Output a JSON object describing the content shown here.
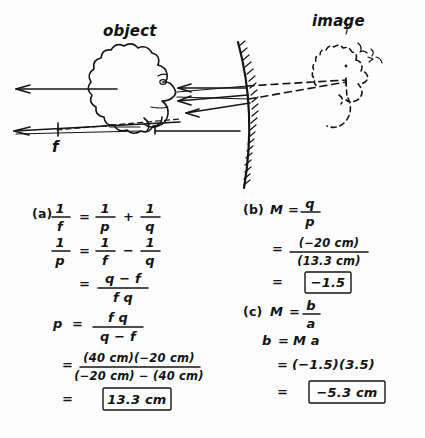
{
  "document": {
    "kind": "handwritten-physics-solution",
    "title_visible": false
  },
  "diagram": {
    "name": "convex-mirror-ray-diagram",
    "object_label": "object",
    "image_label": "image",
    "focal_point_label": "f",
    "mirror_type": "convex-mirror",
    "rays_count": 3,
    "axis_arrow_direction": "left"
  },
  "work": {
    "part_a": {
      "tag": "(a)",
      "lines": [
        {
          "id": "a1",
          "lhs_num": "1",
          "lhs_den": "f",
          "eq": "=",
          "t1_num": "1",
          "t1_den": "p",
          "op": "+",
          "t2_num": "1",
          "t2_den": "q"
        },
        {
          "id": "a2",
          "lhs_num": "1",
          "lhs_den": "p",
          "eq": "=",
          "t1_num": "1",
          "t1_den": "f",
          "op": "−",
          "t2_num": "1",
          "t2_den": "q"
        },
        {
          "id": "a3",
          "eq": "=",
          "num": "q − f",
          "den": "f q"
        },
        {
          "id": "a4",
          "lhs": "p",
          "eq": "=",
          "num": "f q",
          "den": "q − f"
        },
        {
          "id": "a5",
          "eq": "=",
          "num": "(40 cm)(−20 cm)",
          "den": "(−20 cm) − (40 cm)"
        },
        {
          "id": "a6",
          "eq": "=",
          "boxed": "13.3 cm"
        }
      ],
      "answer": "13.3 cm"
    },
    "part_b": {
      "tag": "(b)",
      "lines": [
        {
          "id": "b1",
          "lhs": "M",
          "eq": "=",
          "num": "q",
          "den": "p"
        },
        {
          "id": "b2",
          "eq": "=",
          "num": "(−20 cm)",
          "den": "(13.3 cm)"
        },
        {
          "id": "b3",
          "eq": "=",
          "boxed": "−1.5"
        }
      ],
      "answer": "−1.5"
    },
    "part_c": {
      "tag": "(c)",
      "lines": [
        {
          "id": "c1",
          "lhs": "M",
          "eq": "=",
          "num": "b",
          "den": "a"
        },
        {
          "id": "c2",
          "lhs": "b",
          "eq": "=",
          "rhs": "M a"
        },
        {
          "id": "c3",
          "eq": "=",
          "rhs": "(−1.5)(3.5)"
        },
        {
          "id": "c4",
          "eq": "=",
          "boxed": "−5.3 cm"
        }
      ],
      "answer": "−5.3 cm"
    }
  },
  "colors": {
    "ink": "#141414",
    "paper": "#fdfdfd"
  }
}
